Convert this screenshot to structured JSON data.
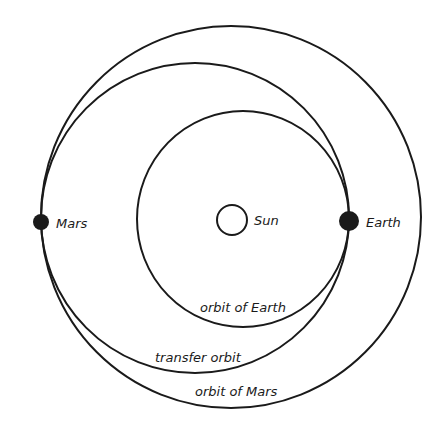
{
  "labels": {
    "sun": "Sun",
    "earth": "Earth",
    "mars": "Mars",
    "orbit_earth": "orbit of Earth",
    "transfer_orbit": "transfer orbit",
    "orbit_mars": "orbit of Mars"
  },
  "geometry": {
    "sun": {
      "cx": 232,
      "cy": 220,
      "r": 15
    },
    "earth": {
      "cx": 349,
      "cy": 221,
      "r": 10
    },
    "mars": {
      "cx": 41,
      "cy": 222,
      "r": 8
    },
    "orbit_earth": {
      "cx": 243,
      "cy": 219,
      "rx": 106,
      "ry": 108
    },
    "transfer_orbit": {
      "cx": 195,
      "cy": 218,
      "rx": 154,
      "ry": 155
    },
    "orbit_mars": {
      "cx": 231,
      "cy": 217,
      "rx": 190,
      "ry": 191
    }
  },
  "colors": {
    "stroke": "#1a1a1a",
    "background": "#ffffff"
  }
}
